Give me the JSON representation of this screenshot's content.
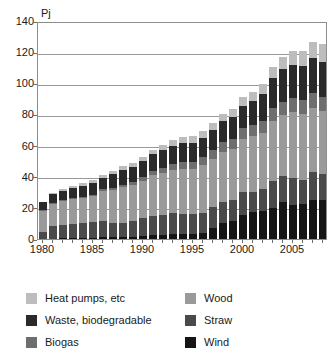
{
  "chart_data": {
    "type": "bar",
    "stacked": true,
    "title": "",
    "subtitle": "",
    "xlabel": "",
    "ylabel": "Pj",
    "unit_label": "Pj",
    "ylim": [
      0,
      140
    ],
    "ytick_values": [
      0,
      20,
      40,
      60,
      80,
      100,
      120,
      140
    ],
    "ytick_labels": [
      "0",
      "20",
      "40",
      "60",
      "80",
      "100",
      "120",
      "140"
    ],
    "grid": true,
    "grid_axis": "y",
    "legend_position": "below",
    "x": [
      1980,
      1981,
      1982,
      1983,
      1984,
      1985,
      1986,
      1987,
      1988,
      1989,
      1990,
      1991,
      1992,
      1993,
      1994,
      1995,
      1996,
      1997,
      1998,
      1999,
      2000,
      2001,
      2002,
      2003,
      2004,
      2005,
      2006,
      2007,
      2008
    ],
    "categories": [
      "1980",
      "1981",
      "1982",
      "1983",
      "1984",
      "1985",
      "1986",
      "1987",
      "1988",
      "1989",
      "1990",
      "1991",
      "1992",
      "1993",
      "1994",
      "1995",
      "1996",
      "1997",
      "1998",
      "1999",
      "2000",
      "2001",
      "2002",
      "2003",
      "2004",
      "2005",
      "2006",
      "2007",
      "2008"
    ],
    "xtick_values": [
      1980,
      1985,
      1990,
      1995,
      2000,
      2005
    ],
    "xtick_labels": [
      "1980",
      "1985",
      "1990",
      "1995",
      "2000",
      "2005"
    ],
    "stack_order_bottom_to_top": [
      "Wind",
      "Straw",
      "Wood",
      "Biogas",
      "Waste, biodegradable",
      "Heat pumps, etc"
    ],
    "series": [
      {
        "name": "Wind",
        "color": "#151515",
        "values": [
          0.2,
          0.3,
          0.4,
          0.5,
          0.6,
          0.8,
          1.0,
          1.2,
          1.4,
          1.6,
          2.0,
          2.3,
          2.6,
          3.0,
          3.2,
          3.4,
          3.6,
          7.0,
          10.0,
          11.5,
          15.5,
          17.5,
          18.0,
          20.0,
          23.5,
          22.0,
          22.5,
          25.0,
          25.0
        ]
      },
      {
        "name": "Straw",
        "color": "#4a4a4a",
        "values": [
          4.0,
          8.0,
          8.5,
          9.0,
          9.5,
          10.0,
          10.5,
          9.0,
          9.0,
          10.0,
          11.5,
          12.5,
          13.0,
          13.5,
          13.0,
          12.5,
          13.0,
          13.5,
          14.0,
          13.5,
          14.5,
          13.0,
          14.0,
          17.5,
          17.0,
          17.5,
          15.5,
          18.0,
          17.0
        ]
      },
      {
        "name": "Wood",
        "color": "#9a9a9a",
        "values": [
          14.0,
          14.5,
          15.5,
          16.0,
          16.5,
          17.0,
          19.5,
          21.5,
          23.0,
          23.0,
          24.0,
          26.0,
          27.0,
          28.0,
          29.0,
          29.0,
          31.0,
          31.0,
          32.0,
          33.0,
          34.0,
          35.5,
          36.0,
          38.0,
          39.0,
          42.0,
          42.0,
          41.0,
          40.0
        ]
      },
      {
        "name": "Biogas",
        "color": "#6e6e6e",
        "values": [
          0.3,
          0.4,
          0.5,
          0.6,
          0.7,
          0.8,
          1.0,
          1.2,
          1.5,
          1.8,
          2.2,
          2.6,
          3.0,
          3.5,
          4.0,
          4.5,
          5.0,
          5.5,
          6.0,
          6.5,
          7.0,
          7.5,
          8.0,
          8.5,
          8.5,
          9.0,
          9.0,
          9.5,
          9.5
        ]
      },
      {
        "name": "Waste, biodegradable",
        "color": "#2a2a2a",
        "values": [
          5.0,
          5.5,
          6.0,
          6.5,
          7.0,
          7.5,
          7.5,
          9.0,
          9.5,
          10.0,
          10.5,
          11.0,
          11.5,
          12.0,
          12.5,
          12.5,
          12.5,
          13.0,
          13.5,
          14.0,
          14.5,
          15.0,
          17.0,
          19.5,
          21.0,
          21.5,
          22.0,
          22.5,
          22.5
        ]
      },
      {
        "name": "Heat pumps, etc",
        "color": "#bdbdbd",
        "values": [
          0.5,
          0.8,
          1.0,
          1.2,
          1.4,
          1.6,
          1.8,
          2.0,
          2.2,
          2.5,
          2.8,
          3.0,
          3.2,
          3.5,
          3.8,
          4.0,
          4.2,
          4.5,
          4.8,
          5.0,
          5.5,
          6.0,
          6.5,
          7.0,
          8.0,
          8.5,
          9.5,
          10.5,
          11.5
        ]
      }
    ],
    "totals": [
      24.0,
      29.5,
      31.9,
      33.8,
      35.7,
      37.7,
      41.3,
      43.9,
      46.6,
      48.9,
      53.0,
      57.4,
      60.3,
      63.5,
      65.5,
      65.9,
      69.3,
      74.5,
      80.3,
      83.5,
      91.0,
      94.5,
      99.5,
      110.5,
      117.0,
      120.5,
      120.5,
      126.5,
      125.5
    ],
    "annotations": []
  },
  "legend": {
    "items": [
      {
        "label": "Heat pumps, etc",
        "color": "#bdbdbd",
        "column": "left"
      },
      {
        "label": "Waste, biodegradable",
        "color": "#2a2a2a",
        "column": "left"
      },
      {
        "label": "Biogas",
        "color": "#6e6e6e",
        "column": "left"
      },
      {
        "label": "Wood",
        "color": "#9a9a9a",
        "column": "right"
      },
      {
        "label": "Straw",
        "color": "#4a4a4a",
        "column": "right"
      },
      {
        "label": "Wind",
        "color": "#151515",
        "column": "right"
      }
    ]
  },
  "colors": {
    "background": "#ffffff",
    "axis": "#8d8d8d",
    "gridline": "#9a9a9a",
    "text": "#1a1a1a"
  }
}
